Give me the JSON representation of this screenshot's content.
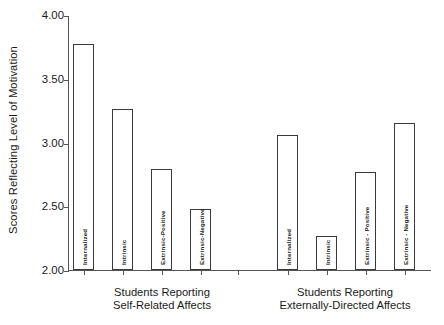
{
  "chart_data": {
    "type": "bar",
    "title": "",
    "subtitle": "",
    "xlabel": "",
    "ylabel": "Scores Reflecting Level of Motivation",
    "ylim": [
      2.0,
      4.0
    ],
    "yticks": [
      2.0,
      2.5,
      3.0,
      3.5,
      4.0
    ],
    "ytick_labels": [
      "2.00",
      "2.50",
      "3.00",
      "3.50",
      "4.00"
    ],
    "grid": false,
    "legend": "none",
    "groups": [
      {
        "caption": "Students Reporting\nSelf-Related Affects",
        "categories": [
          "Internalized",
          "Intrinsic",
          "Extrinsic-Positive",
          "Extrinsic-Negative"
        ],
        "values": [
          3.77,
          3.26,
          2.79,
          2.48
        ]
      },
      {
        "caption": "Students Reporting\nExternally-Directed Affects",
        "categories": [
          "Internalized",
          "Intrinsic",
          "Extrinsic - Positive",
          "Extrinsic - Negative"
        ],
        "values": [
          3.06,
          2.27,
          2.77,
          3.15
        ]
      }
    ],
    "categories": [
      "Internalized",
      "Intrinsic",
      "Extrinsic-Positive",
      "Extrinsic-Negative",
      "Internalized",
      "Intrinsic",
      "Extrinsic - Positive",
      "Extrinsic - Negative"
    ],
    "values": [
      3.77,
      3.26,
      2.79,
      2.48,
      3.06,
      2.27,
      2.77,
      3.15
    ],
    "colors": {
      "bar_fill": "#ffffff",
      "bar_stroke": "#3a3a3a",
      "axis": "#555555",
      "text": "#1a1a1a",
      "background": "#ffffff"
    }
  }
}
